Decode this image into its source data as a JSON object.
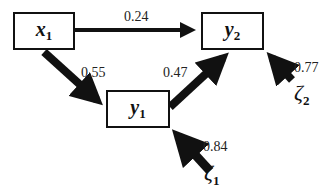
{
  "diagram": {
    "type": "path-diagram",
    "nodes": [
      {
        "id": "x1",
        "symbol": "x",
        "subscript": "1"
      },
      {
        "id": "y1",
        "symbol": "y",
        "subscript": "1"
      },
      {
        "id": "y2",
        "symbol": "y",
        "subscript": "2"
      }
    ],
    "disturbances": [
      {
        "id": "zeta1",
        "symbol": "ζ",
        "subscript": "1",
        "target": "y1",
        "coefficient": "0.84"
      },
      {
        "id": "zeta2",
        "symbol": "ζ",
        "subscript": "2",
        "target": "y2",
        "coefficient": "0.77"
      }
    ],
    "paths": [
      {
        "from": "x1",
        "to": "y2",
        "coefficient": "0.24"
      },
      {
        "from": "x1",
        "to": "y1",
        "coefficient": "0.55"
      },
      {
        "from": "y1",
        "to": "y2",
        "coefficient": "0.47"
      }
    ],
    "colors": {
      "stroke": "#111111",
      "background": "#ffffff"
    }
  }
}
